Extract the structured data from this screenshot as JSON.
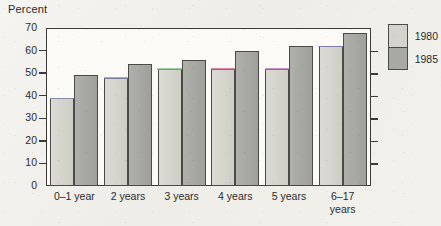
{
  "chart_data": {
    "type": "bar",
    "title": "",
    "ylabel": "Percent",
    "xlabel": "",
    "ylim": [
      0,
      70
    ],
    "ytick_step": 10,
    "yticks": [
      0,
      10,
      20,
      30,
      40,
      50,
      60,
      70
    ],
    "grid": false,
    "legend_position": "right",
    "categories": [
      "0–1 year",
      "2 years",
      "3 years",
      "4 years",
      "5 years",
      "6–17 years"
    ],
    "series": [
      {
        "name": "1980",
        "values": [
          39,
          48,
          52,
          52,
          52,
          62
        ]
      },
      {
        "name": "1985",
        "values": [
          49,
          54,
          56,
          60,
          62,
          68
        ]
      }
    ]
  },
  "axis": {
    "title": "Percent",
    "tick_labels": [
      "70",
      "60",
      "50",
      "40",
      "30",
      "20",
      "10",
      "0"
    ]
  },
  "legend": {
    "items": [
      {
        "label": "1980",
        "color": "#d4d3cd"
      },
      {
        "label": "1985",
        "color": "#a9a9a4"
      }
    ]
  },
  "colors": {
    "series_1980": "#d4d3cd",
    "series_1985": "#a9a9a4",
    "axis": "#3a3a38",
    "bar_outline": "#4a4a47",
    "text": "#2b2b2b",
    "plot_background": "#fbfaf6",
    "page_background": "#f3f2ee"
  },
  "cap_colors": [
    "#9aa6c8",
    "#8f8fb8",
    "#7fbf7f",
    "#cf5f8f",
    "#b06fb0",
    "#8f8fd0"
  ]
}
